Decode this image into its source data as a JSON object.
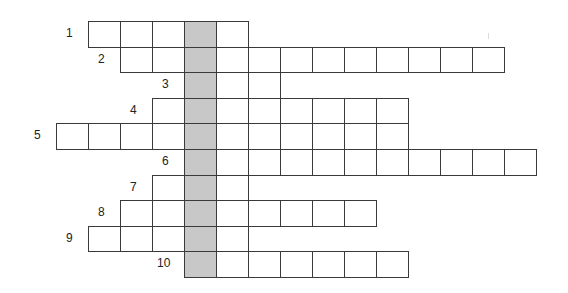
{
  "puzzle": {
    "type": "crossword",
    "shaded_column_index": 4,
    "colors": {
      "cell_border": "#3a3a3a",
      "cell_fill": "#ffffff",
      "shaded_fill": "#c8c8c8",
      "number_text": "#222222"
    },
    "rows": [
      {
        "number": "1",
        "start_col": 1,
        "length": 5
      },
      {
        "number": "2",
        "start_col": 2,
        "length": 12
      },
      {
        "number": "3",
        "start_col": 4,
        "length": 3
      },
      {
        "number": "4",
        "start_col": 3,
        "length": 8
      },
      {
        "number": "5",
        "start_col": 0,
        "length": 11
      },
      {
        "number": "6",
        "start_col": 4,
        "length": 11
      },
      {
        "number": "7",
        "start_col": 3,
        "length": 3
      },
      {
        "number": "8",
        "start_col": 2,
        "length": 8
      },
      {
        "number": "9",
        "start_col": 1,
        "length": 5
      },
      {
        "number": "10",
        "start_col": 4,
        "length": 7
      }
    ]
  }
}
